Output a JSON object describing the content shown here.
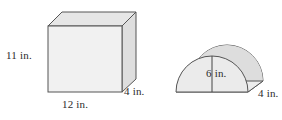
{
  "figure": {
    "background_color": "#ffffff",
    "stroke_color": "#4d4d4d",
    "text_color": "#2b2b2b",
    "units": "in.",
    "shapes": [
      {
        "name": "rectangular-prism",
        "type": "rectangular prism",
        "face_color_front": "#f0f0f0",
        "face_color_top": "#e4e4e4",
        "face_color_side": "#dcdcdc",
        "dimensions": [
          {
            "label": "11 in.",
            "value": 11,
            "unit": "in.",
            "edge": "height"
          },
          {
            "label": "12 in.",
            "value": 12,
            "unit": "in.",
            "edge": "width"
          },
          {
            "label": "4 in.",
            "value": 4,
            "unit": "in.",
            "edge": "depth"
          }
        ]
      },
      {
        "name": "half-cylinder",
        "type": "half cylinder",
        "face_color_front": "#e9e9e9",
        "face_color_body": "#dcdcdc",
        "dimensions": [
          {
            "label": "6 in.",
            "value": 6,
            "unit": "in.",
            "edge": "radius"
          },
          {
            "label": "4 in.",
            "value": 4,
            "unit": "in.",
            "edge": "depth"
          }
        ]
      }
    ]
  },
  "labels": {
    "prism_height": "11 in.",
    "prism_width": "12 in.",
    "prism_depth": "4 in.",
    "cylinder_height": "6 in.",
    "cylinder_depth": "4 in."
  }
}
